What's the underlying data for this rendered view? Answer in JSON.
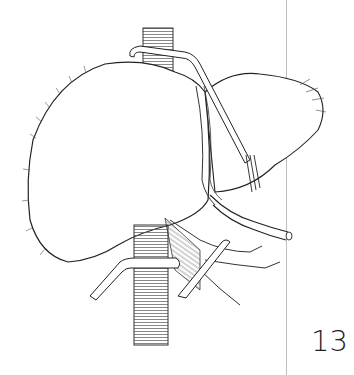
{
  "page": {
    "number": "13"
  },
  "illustration": {
    "subject": "liver with surgical clamps on vena cava and hepatic hilum",
    "stroke_color": "#333333",
    "background_color": "#ffffff"
  },
  "margin_rule": {
    "color": "#bdbdbd"
  }
}
